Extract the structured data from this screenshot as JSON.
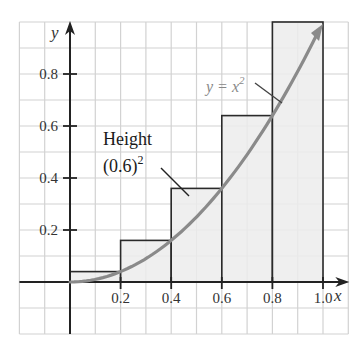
{
  "chart_data": {
    "type": "bar",
    "subtype": "riemann-sum-right-endpoints",
    "title": "",
    "xlabel": "x",
    "ylabel": "y",
    "xlim": [
      -0.2,
      1.1
    ],
    "ylim": [
      -0.2,
      1.0
    ],
    "grid": true,
    "grid_step": 0.1,
    "x_ticks": [
      0.2,
      0.4,
      0.6,
      0.8,
      1.0
    ],
    "x_tick_labels": [
      "0.2",
      "0.4",
      "0.6",
      "0.8",
      "1.0"
    ],
    "y_ticks": [
      0.2,
      0.4,
      0.6,
      0.8
    ],
    "y_tick_labels": [
      "0.2",
      "0.4",
      "0.6",
      "0.8"
    ],
    "categories": [
      "[0,0.2]",
      "[0.2,0.4]",
      "[0.4,0.6]",
      "[0.6,0.8]",
      "[0.8,1.0]"
    ],
    "bars": [
      {
        "x0": 0.0,
        "x1": 0.2,
        "height": 0.04
      },
      {
        "x0": 0.2,
        "x1": 0.4,
        "height": 0.16
      },
      {
        "x0": 0.4,
        "x1": 0.6,
        "height": 0.36
      },
      {
        "x0": 0.6,
        "x1": 0.8,
        "height": 0.64
      },
      {
        "x0": 0.8,
        "x1": 1.0,
        "height": 1.0
      }
    ],
    "values": [
      0.04,
      0.16,
      0.36,
      0.64,
      1.0
    ],
    "series": [
      {
        "name": "y = x^2",
        "type": "line",
        "x": [
          0,
          0.1,
          0.2,
          0.3,
          0.4,
          0.5,
          0.6,
          0.7,
          0.8,
          0.9,
          1.0
        ],
        "values": [
          0,
          0.01,
          0.04,
          0.09,
          0.16,
          0.25,
          0.36,
          0.49,
          0.64,
          0.81,
          1.0
        ]
      }
    ],
    "annotations": [
      {
        "text": "Height",
        "line2": "(0.6)",
        "superscript": "2",
        "points_to_bar": 2
      },
      {
        "text": "y = x",
        "superscript": "2",
        "points_to": "curve"
      }
    ],
    "colors": {
      "bar_fill": "#ececec",
      "bar_stroke": "#2a2a2a",
      "grid": "#d2d2d2",
      "axis": "#222222",
      "curve": "#8a8a8a"
    }
  },
  "labels": {
    "x_axis": "x",
    "y_axis": "y",
    "annotation_height_line1": "Height",
    "annotation_height_line2": "(0.6)",
    "annotation_height_sup": "2",
    "curve_label": "y = x",
    "curve_label_sup": "2",
    "x_ticks": [
      "0.2",
      "0.4",
      "0.6",
      "0.8",
      "1.0"
    ],
    "y_ticks": [
      "0.2",
      "0.4",
      "0.6",
      "0.8"
    ]
  }
}
